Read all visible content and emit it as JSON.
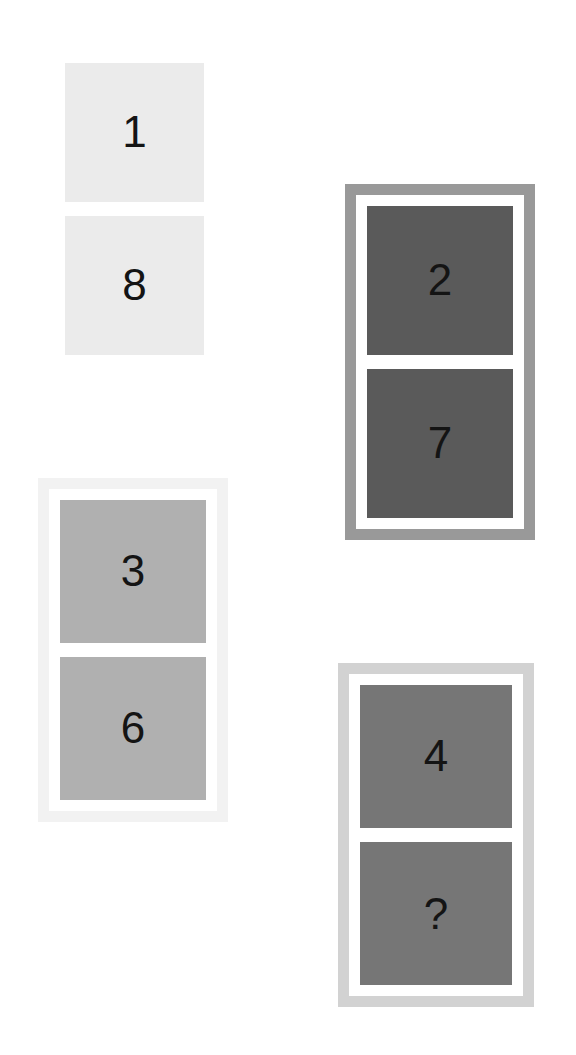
{
  "puzzle": {
    "title": "Number tile pair puzzle",
    "background_color": "#ffffff",
    "text_color": "#141414",
    "groups": [
      {
        "id": "group-1-8",
        "name": "group-top-left",
        "frame_color": "none",
        "tile_color": "#ebebeb",
        "has_frame": false,
        "x": 65,
        "y": 63,
        "width": 139,
        "height": 292,
        "tiles": [
          {
            "id": "tile-1",
            "label": "1",
            "is_unknown": false
          },
          {
            "id": "tile-8",
            "label": "8",
            "is_unknown": false
          }
        ]
      },
      {
        "id": "group-2-7",
        "name": "group-top-right",
        "frame_color": "#999999",
        "tile_color": "#5a5a5a",
        "has_frame": true,
        "x": 345,
        "y": 184,
        "width": 190,
        "height": 356,
        "tiles": [
          {
            "id": "tile-2",
            "label": "2",
            "is_unknown": false
          },
          {
            "id": "tile-7",
            "label": "7",
            "is_unknown": false
          }
        ]
      },
      {
        "id": "group-3-6",
        "name": "group-bottom-left",
        "frame_color": "#f2f2f2",
        "tile_color": "#b0b0b0",
        "has_frame": true,
        "x": 38,
        "y": 478,
        "width": 190,
        "height": 344,
        "tiles": [
          {
            "id": "tile-3",
            "label": "3",
            "is_unknown": false
          },
          {
            "id": "tile-6",
            "label": "6",
            "is_unknown": false
          }
        ]
      },
      {
        "id": "group-4-unknown",
        "name": "group-bottom-right",
        "frame_color": "#d2d2d2",
        "tile_color": "#767676",
        "has_frame": true,
        "x": 338,
        "y": 663,
        "width": 196,
        "height": 344,
        "tiles": [
          {
            "id": "tile-4",
            "label": "4",
            "is_unknown": false
          },
          {
            "id": "tile-unknown",
            "label": "?",
            "is_unknown": true
          }
        ]
      }
    ]
  }
}
